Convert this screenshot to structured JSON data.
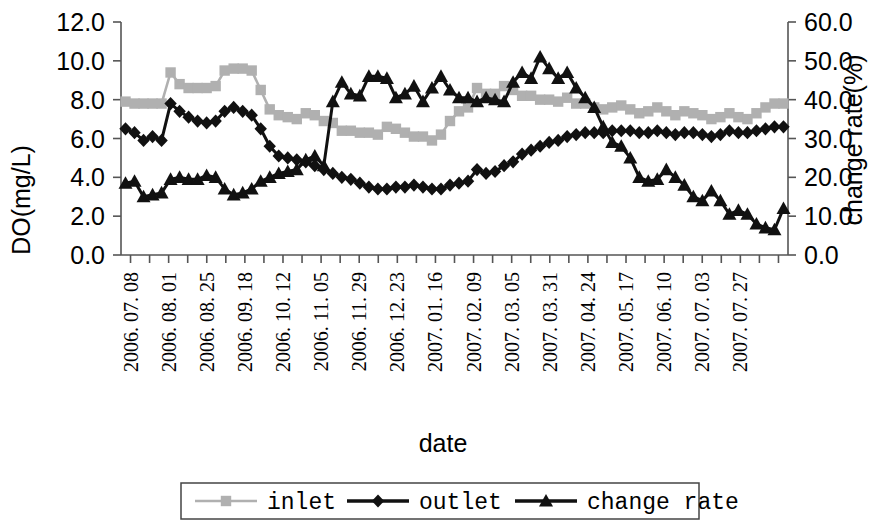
{
  "chart_data": {
    "type": "line",
    "title": "",
    "xlabel": "date",
    "ylabel": "DO(mg/L)",
    "y2label": "change rate(%)",
    "ylim": [
      0.0,
      12.0
    ],
    "y2lim": [
      0.0,
      60.0
    ],
    "yticks": [
      "0.0",
      "2.0",
      "4.0",
      "6.0",
      "8.0",
      "10.0",
      "12.0"
    ],
    "y2ticks": [
      "0.0",
      "10.0",
      "20.0",
      "30.0",
      "40.0",
      "50.0",
      "60.0"
    ],
    "grid": false,
    "legend_position": "bottom",
    "tick_labels": [
      "2006. 07. 08",
      "2006. 08. 01",
      "2006. 08. 25",
      "2006. 09. 18",
      "2006. 10. 12",
      "2006. 11. 05",
      "2006. 11. 29",
      "2006. 12. 23",
      "2007. 01. 16",
      "2007. 02. 09",
      "2007. 03. 05",
      "2007. 03. 31",
      "2007. 04. 24",
      "2007. 05. 17",
      "2007. 06. 10",
      "2007. 07. 03",
      "2007. 07. 27"
    ],
    "series": [
      {
        "name": "inlet",
        "axis": "left",
        "unit": "mg/L",
        "color": "#b0b0b0",
        "marker": "square",
        "values": [
          7.9,
          7.8,
          7.8,
          7.8,
          7.8,
          9.4,
          8.8,
          8.6,
          8.6,
          8.6,
          8.7,
          9.5,
          9.6,
          9.6,
          9.5,
          8.5,
          7.5,
          7.2,
          7.1,
          7.0,
          7.3,
          7.2,
          6.9,
          6.8,
          6.4,
          6.4,
          6.3,
          6.3,
          6.2,
          6.6,
          6.5,
          6.3,
          6.1,
          6.1,
          5.9,
          6.2,
          6.9,
          7.4,
          7.6,
          8.6,
          8.3,
          8.3,
          8.7,
          8.5,
          8.2,
          8.2,
          8.0,
          8.0,
          7.9,
          8.1,
          7.8,
          7.8,
          7.6,
          7.5,
          7.6,
          7.7,
          7.5,
          7.3,
          7.4,
          7.6,
          7.4,
          7.2,
          7.4,
          7.3,
          7.2,
          7.0,
          7.1,
          7.3,
          7.1,
          7.0,
          7.3,
          7.6,
          7.8,
          7.8
        ]
      },
      {
        "name": "outlet",
        "axis": "left",
        "unit": "mg/L",
        "color": "#111111",
        "marker": "diamond",
        "values": [
          6.5,
          6.3,
          5.9,
          6.1,
          5.9,
          7.8,
          7.4,
          7.1,
          6.9,
          6.8,
          6.9,
          7.4,
          7.6,
          7.4,
          7.2,
          6.5,
          5.6,
          5.1,
          5.0,
          4.9,
          4.8,
          4.6,
          4.4,
          4.2,
          4.0,
          3.9,
          3.7,
          3.5,
          3.4,
          3.4,
          3.5,
          3.5,
          3.6,
          3.5,
          3.4,
          3.4,
          3.6,
          3.7,
          3.8,
          4.4,
          4.2,
          4.3,
          4.6,
          4.8,
          5.2,
          5.4,
          5.6,
          5.8,
          5.9,
          6.1,
          6.2,
          6.3,
          6.3,
          6.3,
          6.4,
          6.4,
          6.4,
          6.3,
          6.3,
          6.4,
          6.3,
          6.2,
          6.3,
          6.3,
          6.2,
          6.1,
          6.2,
          6.4,
          6.3,
          6.3,
          6.4,
          6.5,
          6.6,
          6.6
        ]
      },
      {
        "name": "change rate",
        "axis": "right",
        "unit": "%",
        "color": "#111111",
        "marker": "triangle",
        "values": [
          18.5,
          19.0,
          15.0,
          15.5,
          16.0,
          19.5,
          20.0,
          19.5,
          19.5,
          20.5,
          20.0,
          17.0,
          15.5,
          16.0,
          17.0,
          19.0,
          20.0,
          21.0,
          21.5,
          22.0,
          24.5,
          25.5,
          23.0,
          39.5,
          44.5,
          41.5,
          41.0,
          46.0,
          46.0,
          45.5,
          40.5,
          41.5,
          43.5,
          39.5,
          43.0,
          46.0,
          42.5,
          40.5,
          40.5,
          39.5,
          40.5,
          40.0,
          39.5,
          44.5,
          47.0,
          45.5,
          51.0,
          48.0,
          45.5,
          47.0,
          43.0,
          40.5,
          38.0,
          33.0,
          29.0,
          28.0,
          25.0,
          20.0,
          19.0,
          19.5,
          22.0,
          20.0,
          18.0,
          15.0,
          14.0,
          16.5,
          14.0,
          10.5,
          11.5,
          10.5,
          8.0,
          7.0,
          6.5,
          12.0
        ]
      }
    ]
  },
  "legend": {
    "items": [
      {
        "label": "inlet",
        "marker": "square",
        "color": "#b0b0b0"
      },
      {
        "label": "outlet",
        "marker": "diamond",
        "color": "#111111"
      },
      {
        "label": "change rate",
        "marker": "triangle",
        "color": "#111111"
      }
    ]
  }
}
